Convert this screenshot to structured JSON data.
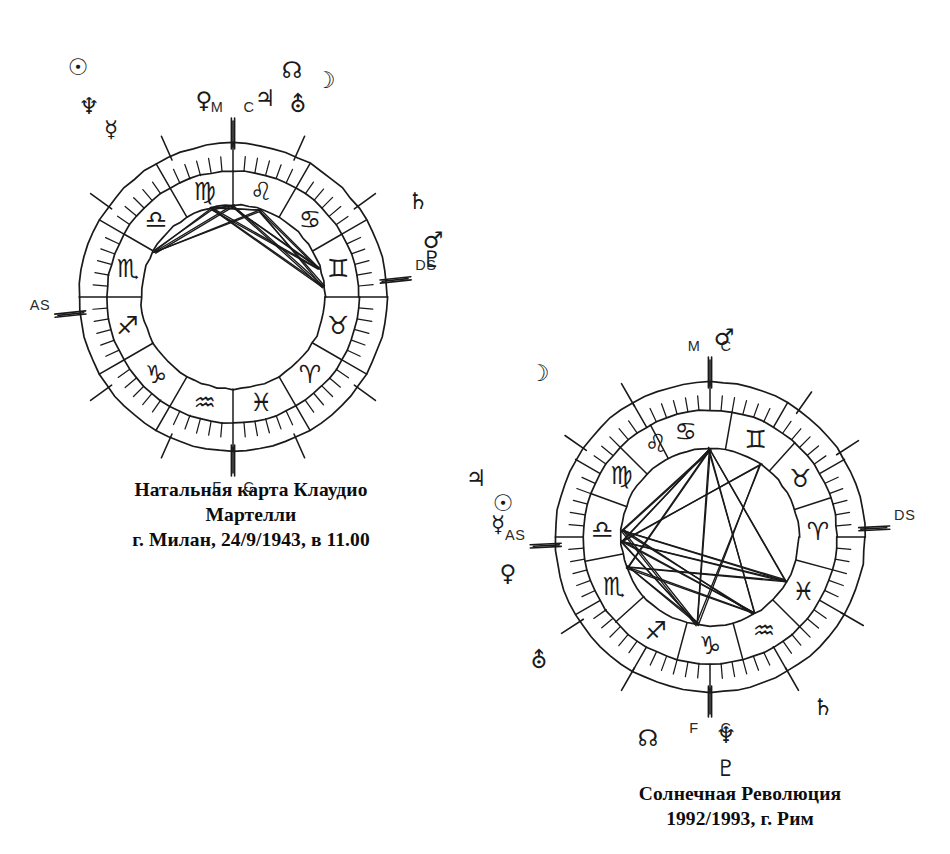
{
  "page": {
    "background_color": "#ffffff",
    "ink_color": "#1a1a1a",
    "width": 950,
    "height": 854
  },
  "charts": [
    {
      "id": "natal",
      "name": "natal-chart",
      "center": {
        "x": 233,
        "y": 297
      },
      "radii": {
        "outer": 154,
        "mid": 126,
        "inner": 92
      },
      "caption": {
        "lines": [
          "Натальная карта Клаудио",
          "Мартелли",
          "г. Милан, 24/9/1943, в 11.00"
        ]
      },
      "axis_labels": [
        {
          "label": "M",
          "angle_deg": 90,
          "side": "left",
          "name": "mc-label-m"
        },
        {
          "label": "C",
          "angle_deg": 90,
          "side": "right",
          "name": "mc-label-c"
        },
        {
          "label": "AS",
          "angle_deg": 186,
          "side": "left",
          "name": "ascendant-label"
        },
        {
          "label": "DS",
          "angle_deg": 6,
          "side": "right",
          "name": "descendant-label"
        },
        {
          "label": "F",
          "angle_deg": 270,
          "side": "left",
          "name": "ic-label-f"
        },
        {
          "label": "C",
          "angle_deg": 270,
          "side": "right",
          "name": "ic-label-c"
        }
      ],
      "signs": [
        {
          "symbol": "♍",
          "name": "virgo",
          "angle_deg": 105
        },
        {
          "symbol": "♌",
          "name": "leo",
          "angle_deg": 75
        },
        {
          "symbol": "♋",
          "name": "cancer",
          "angle_deg": 45
        },
        {
          "symbol": "♊",
          "name": "gemini",
          "angle_deg": 15
        },
        {
          "symbol": "♉",
          "name": "taurus",
          "angle_deg": 345
        },
        {
          "symbol": "♈",
          "name": "aries",
          "angle_deg": 315
        },
        {
          "symbol": "♓",
          "name": "pisces",
          "angle_deg": 285
        },
        {
          "symbol": "♒",
          "name": "aquarius",
          "angle_deg": 255
        },
        {
          "symbol": "♑",
          "name": "capricorn",
          "angle_deg": 225
        },
        {
          "symbol": "♐",
          "name": "sagittarius",
          "angle_deg": 195
        },
        {
          "symbol": "♏",
          "name": "scorpio",
          "angle_deg": 165
        },
        {
          "symbol": "♎",
          "name": "libra",
          "angle_deg": 135
        }
      ],
      "cusp_angles_deg": [
        6,
        36,
        66,
        90,
        114,
        144,
        186,
        216,
        246,
        270,
        294,
        324
      ],
      "planets": [
        {
          "symbol": "☉",
          "name": "sun",
          "x": 78,
          "y": 67
        },
        {
          "symbol": "♆",
          "name": "neptune",
          "x": 89,
          "y": 106
        },
        {
          "symbol": "☿",
          "name": "mercury",
          "x": 111,
          "y": 129
        },
        {
          "symbol": "♀",
          "name": "venus",
          "x": 204,
          "y": 100
        },
        {
          "symbol": "♃",
          "name": "jupiter",
          "x": 265,
          "y": 98
        },
        {
          "symbol": "☊",
          "name": "north-node",
          "x": 292,
          "y": 70
        },
        {
          "symbol": "⛢",
          "name": "uranus",
          "x": 298,
          "y": 104
        },
        {
          "symbol": "☽",
          "name": "moon",
          "x": 325,
          "y": 80
        },
        {
          "symbol": "♄",
          "name": "saturn",
          "x": 418,
          "y": 201
        },
        {
          "symbol": "♂",
          "name": "mars",
          "x": 433,
          "y": 240
        },
        {
          "symbol": "♇",
          "name": "pluto",
          "x": 432,
          "y": 259
        }
      ],
      "aspect_nodes_deg": [
        104,
        90,
        72,
        18,
        6,
        150
      ],
      "aspects": [
        [
          104,
          18
        ],
        [
          104,
          6
        ],
        [
          104,
          90
        ],
        [
          104,
          72
        ],
        [
          90,
          18
        ],
        [
          90,
          6
        ],
        [
          72,
          18
        ],
        [
          72,
          6
        ],
        [
          150,
          90
        ],
        [
          150,
          72
        ],
        [
          104,
          150
        ]
      ]
    },
    {
      "id": "solar",
      "name": "solar-return-chart",
      "center": {
        "x": 710,
        "y": 537
      },
      "radii": {
        "outer": 155,
        "mid": 127,
        "inner": 89
      },
      "caption": {
        "lines": [
          "Солнечная Революция",
          "1992/1993, г. Рим"
        ]
      },
      "axis_labels": [
        {
          "label": "M",
          "angle_deg": 90,
          "side": "left",
          "name": "mc-label-m"
        },
        {
          "label": "C",
          "angle_deg": 90,
          "side": "right",
          "name": "mc-label-c"
        },
        {
          "label": "AS",
          "angle_deg": 183,
          "side": "left",
          "name": "ascendant-label"
        },
        {
          "label": "DS",
          "angle_deg": 3,
          "side": "right",
          "name": "descendant-label"
        },
        {
          "label": "F",
          "angle_deg": 270,
          "side": "left",
          "name": "ic-label-f"
        },
        {
          "label": "C",
          "angle_deg": 270,
          "side": "right",
          "name": "ic-label-c"
        }
      ],
      "signs": [
        {
          "symbol": "♋",
          "name": "cancer",
          "angle_deg": 103
        },
        {
          "symbol": "♊",
          "name": "gemini",
          "angle_deg": 65
        },
        {
          "symbol": "♉",
          "name": "taurus",
          "angle_deg": 33
        },
        {
          "symbol": "♈",
          "name": "aries",
          "angle_deg": 3
        },
        {
          "symbol": "♓",
          "name": "pisces",
          "angle_deg": 330
        },
        {
          "symbol": "♒",
          "name": "aquarius",
          "angle_deg": 300
        },
        {
          "symbol": "♑",
          "name": "capricorn",
          "angle_deg": 270
        },
        {
          "symbol": "♐",
          "name": "sagittarius",
          "angle_deg": 240
        },
        {
          "symbol": "♏",
          "name": "scorpio",
          "angle_deg": 207
        },
        {
          "symbol": "♎",
          "name": "libra",
          "angle_deg": 176
        },
        {
          "symbol": "♍",
          "name": "virgo",
          "angle_deg": 145
        },
        {
          "symbol": "♌",
          "name": "leo",
          "angle_deg": 120
        }
      ],
      "cusp_angles_deg": [
        3,
        33,
        55,
        90,
        120,
        145,
        183,
        213,
        240,
        270,
        300,
        330
      ],
      "planets": [
        {
          "symbol": "☽",
          "name": "moon",
          "x": 539,
          "y": 373
        },
        {
          "symbol": "♂",
          "name": "mars",
          "x": 724,
          "y": 337
        },
        {
          "symbol": "♃",
          "name": "jupiter",
          "x": 476,
          "y": 478
        },
        {
          "symbol": "☉",
          "name": "sun",
          "x": 503,
          "y": 503
        },
        {
          "symbol": "☿",
          "name": "mercury",
          "x": 498,
          "y": 524
        },
        {
          "symbol": "♀",
          "name": "venus",
          "x": 508,
          "y": 573
        },
        {
          "symbol": "⛢",
          "name": "uranus",
          "x": 539,
          "y": 660
        },
        {
          "symbol": "☊",
          "name": "north-node",
          "x": 648,
          "y": 738
        },
        {
          "symbol": "♆",
          "name": "neptune",
          "x": 726,
          "y": 735
        },
        {
          "symbol": "♇",
          "name": "pluto",
          "x": 726,
          "y": 768
        },
        {
          "symbol": "♄",
          "name": "saturn",
          "x": 823,
          "y": 707
        }
      ],
      "aspect_nodes_deg": [
        90,
        183,
        176,
        200,
        262,
        300,
        330,
        55
      ],
      "aspects": [
        [
          90,
          183
        ],
        [
          90,
          176
        ],
        [
          90,
          200
        ],
        [
          90,
          262
        ],
        [
          90,
          300
        ],
        [
          183,
          300
        ],
        [
          183,
          330
        ],
        [
          183,
          262
        ],
        [
          176,
          300
        ],
        [
          176,
          262
        ],
        [
          200,
          300
        ],
        [
          200,
          330
        ],
        [
          262,
          55
        ],
        [
          183,
          55
        ],
        [
          176,
          330
        ],
        [
          90,
          330
        ],
        [
          200,
          262
        ]
      ]
    }
  ]
}
